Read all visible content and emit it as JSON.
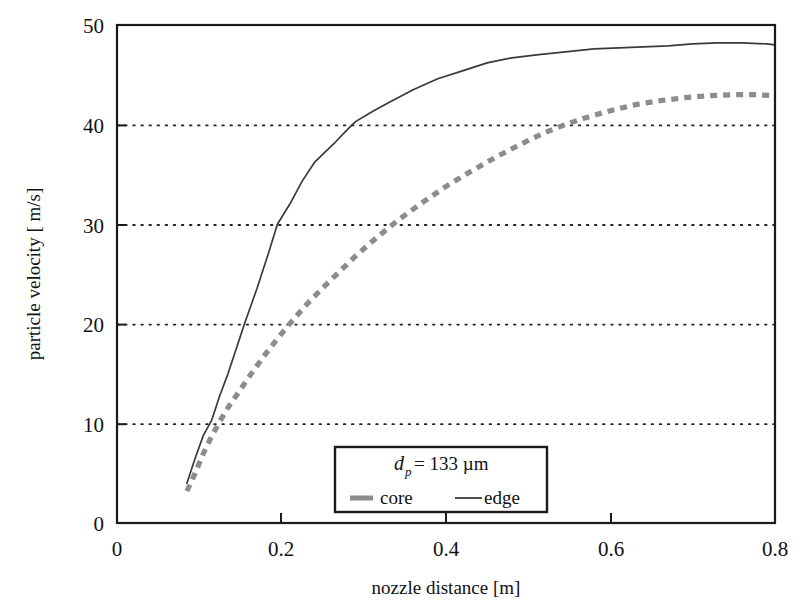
{
  "chart_data": {
    "type": "line",
    "title": "",
    "xlabel": "nozzle distance [m]",
    "ylabel": "particle velocity [ m/s]",
    "xlim": [
      0,
      0.8
    ],
    "ylim": [
      0,
      50
    ],
    "xticks": [
      "0",
      "0.2",
      "0.4",
      "0.6",
      "0.8"
    ],
    "xtick_values": [
      0,
      0.2,
      0.4,
      0.6,
      0.8
    ],
    "yticks": [
      "0",
      "10",
      "20",
      "30",
      "40",
      "50"
    ],
    "ytick_values": [
      0,
      10,
      20,
      30,
      40,
      50
    ],
    "grid": "horizontal-dotted",
    "grid_color": "#222222",
    "legend_position": "bottom-center-inside",
    "annotation": "d_p = 133 um",
    "series": [
      {
        "name": "core",
        "style": "dashed",
        "color": "#8c8c8c",
        "width": 5,
        "points": [
          [
            0.085,
            3.2
          ],
          [
            0.095,
            5.0
          ],
          [
            0.105,
            7.0
          ],
          [
            0.115,
            8.7
          ],
          [
            0.125,
            10.2
          ],
          [
            0.135,
            11.6
          ],
          [
            0.15,
            13.4
          ],
          [
            0.165,
            15.2
          ],
          [
            0.18,
            16.9
          ],
          [
            0.195,
            18.5
          ],
          [
            0.21,
            20.0
          ],
          [
            0.23,
            21.9
          ],
          [
            0.25,
            23.6
          ],
          [
            0.27,
            25.2
          ],
          [
            0.29,
            26.8
          ],
          [
            0.315,
            28.6
          ],
          [
            0.34,
            30.3
          ],
          [
            0.37,
            32.1
          ],
          [
            0.4,
            33.8
          ],
          [
            0.43,
            35.3
          ],
          [
            0.46,
            36.7
          ],
          [
            0.49,
            38.0
          ],
          [
            0.52,
            39.2
          ],
          [
            0.545,
            40.0
          ],
          [
            0.57,
            40.7
          ],
          [
            0.6,
            41.4
          ],
          [
            0.63,
            42.0
          ],
          [
            0.66,
            42.4
          ],
          [
            0.69,
            42.7
          ],
          [
            0.72,
            42.9
          ],
          [
            0.75,
            43.0
          ],
          [
            0.775,
            43.0
          ],
          [
            0.8,
            42.9
          ]
        ]
      },
      {
        "name": "edge",
        "style": "solid",
        "color": "#3a3a3a",
        "width": 1.6,
        "points": [
          [
            0.085,
            4.0
          ],
          [
            0.095,
            6.5
          ],
          [
            0.105,
            8.8
          ],
          [
            0.115,
            10.3
          ],
          [
            0.125,
            12.8
          ],
          [
            0.135,
            15.0
          ],
          [
            0.145,
            17.5
          ],
          [
            0.155,
            20.0
          ],
          [
            0.17,
            23.5
          ],
          [
            0.185,
            27.3
          ],
          [
            0.195,
            30.0
          ],
          [
            0.21,
            32.0
          ],
          [
            0.225,
            34.3
          ],
          [
            0.24,
            36.2
          ],
          [
            0.25,
            37.0
          ],
          [
            0.265,
            38.2
          ],
          [
            0.28,
            39.5
          ],
          [
            0.29,
            40.3
          ],
          [
            0.31,
            41.3
          ],
          [
            0.33,
            42.2
          ],
          [
            0.36,
            43.5
          ],
          [
            0.39,
            44.6
          ],
          [
            0.42,
            45.4
          ],
          [
            0.45,
            46.2
          ],
          [
            0.48,
            46.7
          ],
          [
            0.51,
            47.0
          ],
          [
            0.545,
            47.3
          ],
          [
            0.58,
            47.6
          ],
          [
            0.61,
            47.7
          ],
          [
            0.64,
            47.8
          ],
          [
            0.67,
            47.9
          ],
          [
            0.7,
            48.1
          ],
          [
            0.73,
            48.2
          ],
          [
            0.76,
            48.2
          ],
          [
            0.79,
            48.1
          ],
          [
            0.8,
            48.0
          ]
        ]
      }
    ],
    "legend": {
      "particle_diameter_symbol": "d",
      "particle_diameter_sub": "p",
      "particle_diameter_value": "= 133  µm",
      "entries": [
        {
          "label": "core",
          "style": "dashed",
          "color": "#8c8c8c"
        },
        {
          "label": "edge",
          "style": "solid",
          "color": "#3a3a3a"
        }
      ]
    }
  },
  "frame": {
    "plot_left": 117,
    "plot_right": 775,
    "plot_top": 25,
    "plot_bottom": 523,
    "border_color": "#1a1a1a"
  }
}
